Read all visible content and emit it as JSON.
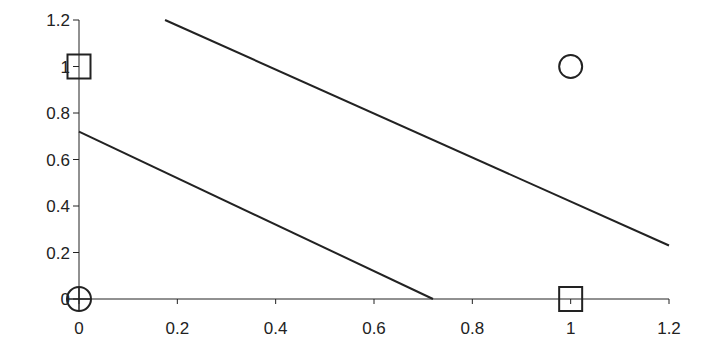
{
  "chart_data": {
    "type": "scatter",
    "title": "",
    "xlabel": "",
    "ylabel": "",
    "xlim": [
      0,
      1.2
    ],
    "ylim": [
      0,
      1.2
    ],
    "grid": false,
    "legend": null,
    "x_ticks": [
      "0",
      "0.2",
      "0.4",
      "0.6",
      "0.8",
      "1",
      "1.2"
    ],
    "y_ticks": [
      "0",
      "0.2",
      "0.4",
      "0.6",
      "0.8",
      "1",
      "1.2"
    ],
    "points": [
      {
        "x": 0,
        "y": 0,
        "marker": "circle-plus"
      },
      {
        "x": 0,
        "y": 1,
        "marker": "square"
      },
      {
        "x": 1,
        "y": 0,
        "marker": "square"
      },
      {
        "x": 1,
        "y": 1,
        "marker": "circle"
      }
    ],
    "lines": [
      {
        "name": "lower-boundary",
        "x": [
          0,
          0.72
        ],
        "y": [
          0.72,
          0
        ]
      },
      {
        "name": "upper-boundary",
        "x": [
          0.175,
          1.2
        ],
        "y": [
          1.2,
          0.23
        ]
      }
    ],
    "colors": {
      "ink": "#222222",
      "background": "#ffffff"
    }
  }
}
